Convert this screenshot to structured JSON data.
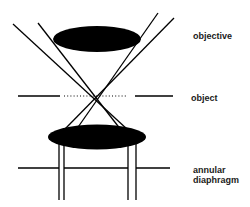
{
  "diagram": {
    "title": "",
    "labels": {
      "objective": "objective",
      "object": "object",
      "annular_line1": "annular",
      "annular_line2": "diaphragm"
    },
    "components": [
      {
        "id": "objective-lens",
        "shape": "ellipse",
        "fill": "#000000"
      },
      {
        "id": "object-plane",
        "shape": "line-with-dotted-center"
      },
      {
        "id": "condenser-lens",
        "shape": "ellipse",
        "fill": "#000000"
      },
      {
        "id": "annular-diaphragm",
        "shape": "line-with-annular-opening"
      },
      {
        "id": "light-rays",
        "shape": "crossing-lines",
        "crossing_at": "object"
      }
    ],
    "colors": {
      "ink": "#000000",
      "background": "#ffffff",
      "text": "#1a1a1a"
    }
  }
}
